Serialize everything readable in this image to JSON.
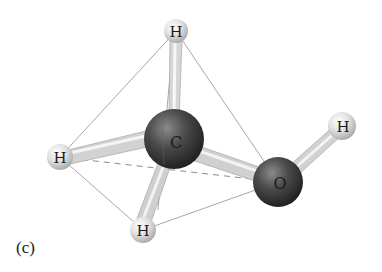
{
  "figure": {
    "label": "(c)",
    "molecule": "methanol",
    "atoms": [
      {
        "id": "H1",
        "element": "H",
        "label": "H",
        "x": 176,
        "y": 31,
        "r": 12
      },
      {
        "id": "C",
        "element": "C",
        "label": "C",
        "x": 174,
        "y": 139,
        "r": 30
      },
      {
        "id": "H2",
        "element": "H",
        "label": "H",
        "x": 60,
        "y": 157,
        "r": 13
      },
      {
        "id": "O",
        "element": "O",
        "label": "O",
        "x": 278,
        "y": 182,
        "r": 25
      },
      {
        "id": "H3",
        "element": "H",
        "label": "H",
        "x": 342,
        "y": 126,
        "r": 14
      },
      {
        "id": "H4",
        "element": "H",
        "label": "H",
        "x": 143,
        "y": 230,
        "r": 13
      }
    ],
    "bonds": [
      [
        "C",
        "H1"
      ],
      [
        "C",
        "H2"
      ],
      [
        "C",
        "O"
      ],
      [
        "C",
        "H4"
      ],
      [
        "O",
        "H3"
      ]
    ],
    "tetrahedron_edges_solid": [
      [
        "H1",
        "H2"
      ],
      [
        "H1",
        "O"
      ],
      [
        "H2",
        "H4"
      ],
      [
        "H4",
        "O"
      ],
      [
        "H1",
        "H4"
      ]
    ],
    "tetrahedron_edges_dashed": [
      [
        "H2",
        "O"
      ]
    ],
    "colors": {
      "hydrogen": "#d8d8d8",
      "carbon": "#3a3a3a",
      "oxygen": "#3a3a3a",
      "bond": "#c8c8c8",
      "edge": "#a8a8a8",
      "dashed": "#8a8a8a"
    }
  }
}
